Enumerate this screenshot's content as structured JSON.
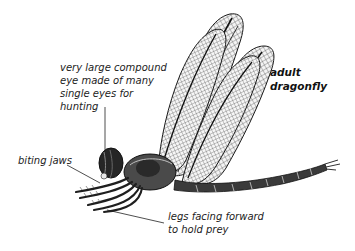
{
  "title": {
    "line1": "adult",
    "line2": "dragonfly"
  },
  "labels": {
    "eye": {
      "line1": "very large compound",
      "line2": "eye made of many",
      "line3": "single eyes for",
      "line4": "hunting"
    },
    "jaws": {
      "line1": "biting jaws"
    },
    "legs": {
      "line1": "legs facing forward",
      "line2": "to hold prey"
    }
  },
  "colors": {
    "ink": "#1a1a1a",
    "background": "#ffffff"
  }
}
